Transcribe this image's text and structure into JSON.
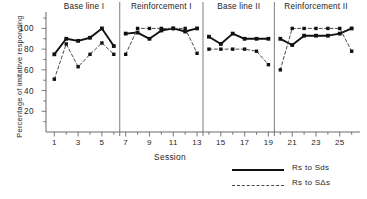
{
  "chart_data": {
    "type": "line",
    "title": "",
    "xlabel": "Session",
    "ylabel": "Percentage of imitative responding",
    "xlim": [
      0.3,
      26.7
    ],
    "ylim": [
      0,
      112
    ],
    "grid": false,
    "legend_position": "bottom-right",
    "yticks": [
      20,
      40,
      60,
      80,
      100
    ],
    "xticks_major": [
      1,
      3,
      5,
      7,
      9,
      11,
      13,
      15,
      17,
      19,
      21,
      23,
      25
    ],
    "xticks_minor": [
      2,
      4,
      6,
      8,
      10,
      12,
      14,
      16,
      18,
      20,
      22,
      24,
      26
    ],
    "phases": [
      {
        "label": "Base line I",
        "start": 1,
        "end": 6,
        "center": 3.5
      },
      {
        "label": "Reinforcement I",
        "start": 7,
        "end": 13,
        "center": 10.0
      },
      {
        "label": "Base line II",
        "start": 14,
        "end": 19,
        "center": 16.5
      },
      {
        "label": "Reinforcement II",
        "start": 20,
        "end": 26,
        "center": 23.0
      }
    ],
    "phase_dividers": [
      6.5,
      13.5,
      19.5
    ],
    "series": [
      {
        "name": "Rs to Sds",
        "style": "solid",
        "marker": "filled-square",
        "color": "#111111",
        "x": [
          1,
          2,
          3,
          4,
          5,
          6,
          7,
          8,
          9,
          10,
          11,
          12,
          13,
          14,
          15,
          16,
          17,
          18,
          19,
          20,
          21,
          22,
          23,
          24,
          25,
          26
        ],
        "values": [
          75,
          90,
          88,
          91,
          100,
          83,
          95,
          96,
          90,
          98,
          100,
          97,
          100,
          92,
          85,
          95,
          90,
          90,
          90,
          90,
          84,
          93,
          93,
          93,
          95,
          100
        ]
      },
      {
        "name": "Rs to SΔs",
        "style": "dashed",
        "marker": "filled-square",
        "color": "#4a4a4a",
        "x": [
          1,
          2,
          3,
          4,
          5,
          6,
          7,
          8,
          9,
          10,
          11,
          12,
          13,
          14,
          15,
          16,
          17,
          18,
          19,
          20,
          21,
          22,
          23,
          24,
          25,
          26
        ],
        "values": [
          51,
          85,
          63,
          75,
          86,
          75,
          75,
          100,
          100,
          100,
          100,
          100,
          76,
          80,
          80,
          80,
          80,
          78,
          65,
          60,
          100,
          100,
          100,
          100,
          100,
          78
        ]
      }
    ]
  },
  "legend": {
    "entries": [
      {
        "label": "Rs to Sds"
      },
      {
        "label": "Rs to SΔs"
      }
    ]
  }
}
